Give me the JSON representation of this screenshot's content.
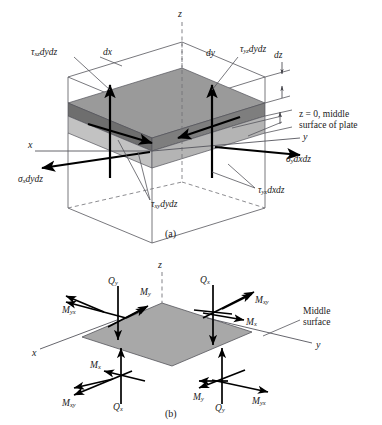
{
  "figure": {
    "panels": [
      {
        "id": "a",
        "caption": "(a)",
        "axes": {
          "x": "x",
          "y": "y",
          "z": "z"
        },
        "dimension_labels": {
          "dx": "dx",
          "dy": "dy",
          "dz": "dz"
        },
        "annotation": {
          "line1": "z = 0, middle",
          "line2": "surface of plate"
        },
        "stress_labels": [
          {
            "name": "tau-xz-dydz",
            "symbol": "τ",
            "sub": "xz",
            "diff": "dydz"
          },
          {
            "name": "tau-yz-dydz",
            "symbol": "τ",
            "sub": "yz",
            "diff": "dydz"
          },
          {
            "name": "sigma-x-dydz",
            "symbol": "σ",
            "sub": "x",
            "diff": "dydz"
          },
          {
            "name": "sigma-y-dxdz",
            "symbol": "σ",
            "sub": "y",
            "diff": "dxdz"
          },
          {
            "name": "tau-yx-dxdz",
            "symbol": "τ",
            "sub": "yx",
            "diff": "dxdz"
          },
          {
            "name": "tau-xy-dydz",
            "symbol": "τ",
            "sub": "xy",
            "diff": "dydz"
          }
        ]
      },
      {
        "id": "b",
        "caption": "(b)",
        "axes": {
          "x": "x",
          "y": "y",
          "z": "z"
        },
        "annotation": {
          "line1": "Middle",
          "line2": "surface"
        },
        "moment_labels": [
          {
            "name": "M-yx-upper-left",
            "symbol": "M",
            "sub": "yx"
          },
          {
            "name": "Q-y-upper-left",
            "symbol": "Q",
            "sub": "y"
          },
          {
            "name": "M-y-upper-left",
            "symbol": "M",
            "sub": "y"
          },
          {
            "name": "Q-x-upper-right",
            "symbol": "Q",
            "sub": "x"
          },
          {
            "name": "M-xy-upper-right",
            "symbol": "M",
            "sub": "xy"
          },
          {
            "name": "M-x-upper-right",
            "symbol": "M",
            "sub": "x"
          },
          {
            "name": "M-x-lower-left",
            "symbol": "M",
            "sub": "x"
          },
          {
            "name": "M-xy-lower-left",
            "symbol": "M",
            "sub": "xy"
          },
          {
            "name": "Q-x-lower-left",
            "symbol": "Q",
            "sub": "x"
          },
          {
            "name": "M-y-lower-right",
            "symbol": "M",
            "sub": "y"
          },
          {
            "name": "Q-y-lower-right",
            "symbol": "Q",
            "sub": "y"
          },
          {
            "name": "M-yx-lower-right",
            "symbol": "M",
            "sub": "yx"
          }
        ]
      }
    ],
    "colors": {
      "background": "#ffffff",
      "slab_top_face": "#8f8f8f",
      "slab_front_face": "#6f6f6f",
      "slab_lower_face": "#b6b6b6",
      "plate_fill": "#a8a8a8",
      "line": "#55555c",
      "vector": "#000000",
      "dashed_axis": "#8d8d93"
    }
  }
}
